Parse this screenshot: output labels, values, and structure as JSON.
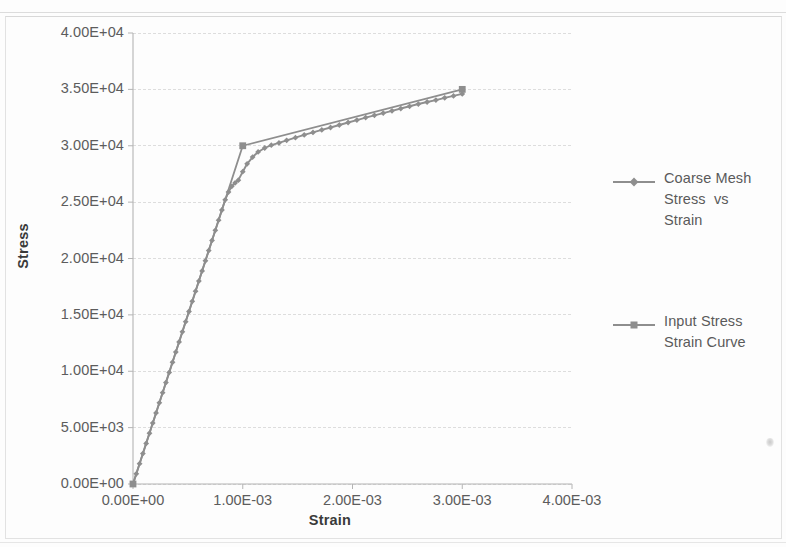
{
  "chart_data": {
    "type": "line",
    "title": "",
    "xlabel": "Strain",
    "ylabel": "Stress",
    "xlim": [
      0,
      0.004
    ],
    "ylim": [
      0,
      40000
    ],
    "grid": true,
    "grid_axis": "y",
    "legend_position": "right",
    "line_color": "#8e8e8e",
    "xticks": [
      "0.00E+00",
      "1.00E-03",
      "2.00E-03",
      "3.00E-03",
      "4.00E-03"
    ],
    "xtick_values": [
      0,
      0.001,
      0.002,
      0.003,
      0.004
    ],
    "yticks": [
      "0.00E+00",
      "5.00E+03",
      "1.00E+04",
      "1.50E+04",
      "2.00E+04",
      "2.50E+04",
      "3.00E+04",
      "3.50E+04",
      "4.00E+04"
    ],
    "ytick_values": [
      0,
      5000,
      10000,
      15000,
      20000,
      25000,
      30000,
      35000,
      40000
    ],
    "series": [
      {
        "name": "Coarse Mesh Stress  vs Strain",
        "marker": "diamond",
        "color": "#8e8e8e",
        "x": [
          0.0,
          3e-05,
          6e-05,
          9e-05,
          0.00012,
          0.00015,
          0.00018,
          0.00021,
          0.00024,
          0.00027,
          0.0003,
          0.00033,
          0.00036,
          0.00039,
          0.00042,
          0.00045,
          0.00048,
          0.00051,
          0.00054,
          0.00057,
          0.0006,
          0.00063,
          0.00066,
          0.00069,
          0.00072,
          0.00075,
          0.00078,
          0.00081,
          0.00084,
          0.00087,
          0.0009,
          0.00093,
          0.00096,
          0.001,
          0.00104,
          0.00109,
          0.00114,
          0.0012,
          0.00126,
          0.00133,
          0.0014,
          0.00148,
          0.00156,
          0.00164,
          0.00172,
          0.0018,
          0.00188,
          0.00196,
          0.00204,
          0.00212,
          0.0022,
          0.00228,
          0.00236,
          0.00244,
          0.00252,
          0.0026,
          0.00268,
          0.00276,
          0.00284,
          0.00292,
          0.003
        ],
        "y": [
          0,
          900,
          1800,
          2700,
          3600,
          4500,
          5400,
          6300,
          7200,
          8100,
          9000,
          9900,
          10800,
          11700,
          12600,
          13500,
          14400,
          15300,
          16200,
          17100,
          18000,
          18900,
          19800,
          20700,
          21600,
          22500,
          23400,
          24300,
          25200,
          25900,
          26400,
          26700,
          26950,
          27700,
          28400,
          29000,
          29450,
          29800,
          30050,
          30250,
          30480,
          30720,
          30960,
          31180,
          31400,
          31620,
          31840,
          32060,
          32280,
          32500,
          32700,
          32900,
          33100,
          33300,
          33500,
          33700,
          33880,
          34050,
          34250,
          34420,
          34600
        ]
      },
      {
        "name": "Input Stress Strain Curve",
        "marker": "square",
        "color": "#8e8e8e",
        "x": [
          0.0,
          0.001,
          0.003
        ],
        "y": [
          0,
          30000,
          35000
        ]
      }
    ],
    "annotations": []
  },
  "axes": {
    "y_title": "Stress",
    "x_title": "Strain"
  },
  "legend": {
    "entries": [
      {
        "marker": "diamond",
        "lines": [
          "Coarse Mesh",
          "Stress  vs",
          "Strain"
        ]
      },
      {
        "marker": "square",
        "lines": [
          "Input Stress",
          "Strain Curve"
        ]
      }
    ]
  }
}
